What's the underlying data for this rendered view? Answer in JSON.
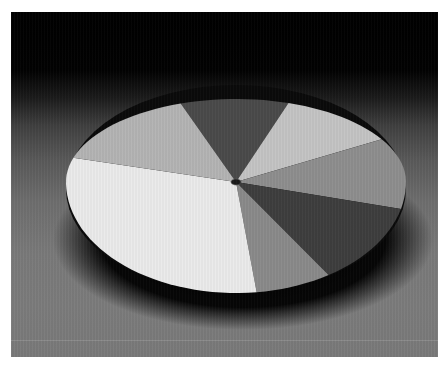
{
  "chart_data": {
    "type": "pie",
    "title": "",
    "style": "3d-perspective-disc",
    "legend": "none",
    "labels": "none",
    "slices": [
      {
        "name": "slice-1",
        "value": 10,
        "color": "#4a4a4a",
        "start_deg": 109,
        "end_deg": 72
      },
      {
        "name": "slice-2",
        "value": 11,
        "color": "#c4c4c4",
        "start_deg": 72,
        "end_deg": 31
      },
      {
        "name": "slice-3",
        "value": 12.5,
        "color": "#8e8e8e",
        "start_deg": 31,
        "end_deg": -14
      },
      {
        "name": "slice-4",
        "value": 12,
        "color": "#3e3e3e",
        "start_deg": -14,
        "end_deg": -57
      },
      {
        "name": "slice-5",
        "value": 7,
        "color": "#8a8a8a",
        "start_deg": -57,
        "end_deg": -83
      },
      {
        "name": "slice-6",
        "value": 32,
        "color": "#ebebeb",
        "start_deg": -83,
        "end_deg": -197
      },
      {
        "name": "slice-7",
        "value": 15.5,
        "color": "#b4b4b4",
        "start_deg": 163,
        "end_deg": 109
      }
    ],
    "colors": {
      "background_top": "#000000",
      "background_bottom": "#7a7a7a",
      "shadow": "#050505",
      "center_hub": "#1a1a1a"
    }
  }
}
